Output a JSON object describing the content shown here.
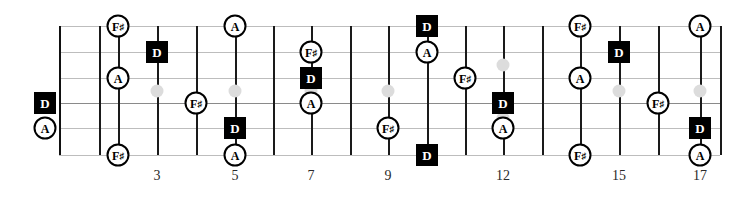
{
  "diagram": {
    "type": "guitar-fretboard",
    "strings": 6,
    "frets_shown": 18,
    "string_y": [
      26,
      52,
      78,
      103,
      128,
      155
    ],
    "fret_x": [
      59,
      99,
      118,
      157,
      196,
      235,
      273,
      311,
      350,
      388,
      427,
      465,
      503,
      542,
      580,
      619,
      658,
      700,
      720
    ],
    "nut_x": 59,
    "board_left": 59,
    "board_right": 720
  },
  "fret_numbers": [
    {
      "label": "3",
      "x": 157
    },
    {
      "label": "5",
      "x": 235
    },
    {
      "label": "7",
      "x": 311
    },
    {
      "label": "9",
      "x": 388
    },
    {
      "label": "12",
      "x": 503
    },
    {
      "label": "15",
      "x": 619
    },
    {
      "label": "17",
      "x": 700
    }
  ],
  "inlays": [
    {
      "x": 157,
      "y": 91
    },
    {
      "x": 235,
      "y": 91
    },
    {
      "x": 311,
      "y": 91
    },
    {
      "x": 388,
      "y": 91
    },
    {
      "x": 503,
      "y": 65
    },
    {
      "x": 503,
      "y": 118
    },
    {
      "x": 619,
      "y": 91
    },
    {
      "x": 700,
      "y": 91
    }
  ],
  "notes": [
    {
      "label": "D",
      "kind": "root",
      "x": 45,
      "y": 103,
      "string": 4,
      "fret": 0
    },
    {
      "label": "A",
      "kind": "tone",
      "x": 45,
      "y": 128,
      "string": 5,
      "fret": 0
    },
    {
      "label": "F#",
      "kind": "tone",
      "x": 118,
      "y": 26,
      "string": 1,
      "fret": 2
    },
    {
      "label": "A",
      "kind": "tone",
      "x": 118,
      "y": 78,
      "string": 3,
      "fret": 2
    },
    {
      "label": "F#",
      "kind": "tone",
      "x": 118,
      "y": 155,
      "string": 6,
      "fret": 2
    },
    {
      "label": "D",
      "kind": "root",
      "x": 157,
      "y": 52,
      "string": 2,
      "fret": 3
    },
    {
      "label": "A",
      "kind": "tone",
      "x": 235,
      "y": 26,
      "string": 1,
      "fret": 5
    },
    {
      "label": "F#",
      "kind": "tone",
      "x": 196,
      "y": 103,
      "string": 4,
      "fret": 4
    },
    {
      "label": "D",
      "kind": "root",
      "x": 235,
      "y": 128,
      "string": 5,
      "fret": 5
    },
    {
      "label": "A",
      "kind": "tone",
      "x": 235,
      "y": 155,
      "string": 6,
      "fret": 5
    },
    {
      "label": "F#",
      "kind": "tone",
      "x": 311,
      "y": 52,
      "string": 2,
      "fret": 7
    },
    {
      "label": "D",
      "kind": "root",
      "x": 311,
      "y": 78,
      "string": 3,
      "fret": 7
    },
    {
      "label": "A",
      "kind": "tone",
      "x": 311,
      "y": 103,
      "string": 4,
      "fret": 7
    },
    {
      "label": "F#",
      "kind": "tone",
      "x": 388,
      "y": 128,
      "string": 5,
      "fret": 9
    },
    {
      "label": "D",
      "kind": "root",
      "x": 427,
      "y": 26,
      "string": 1,
      "fret": 10
    },
    {
      "label": "A",
      "kind": "tone",
      "x": 427,
      "y": 52,
      "string": 2,
      "fret": 10
    },
    {
      "label": "D",
      "kind": "root",
      "x": 427,
      "y": 155,
      "string": 6,
      "fret": 10
    },
    {
      "label": "F#",
      "kind": "tone",
      "x": 465,
      "y": 78,
      "string": 3,
      "fret": 11
    },
    {
      "label": "D",
      "kind": "root",
      "x": 503,
      "y": 103,
      "string": 4,
      "fret": 12
    },
    {
      "label": "A",
      "kind": "tone",
      "x": 503,
      "y": 128,
      "string": 5,
      "fret": 12
    },
    {
      "label": "F#",
      "kind": "tone",
      "x": 580,
      "y": 26,
      "string": 1,
      "fret": 14
    },
    {
      "label": "A",
      "kind": "tone",
      "x": 580,
      "y": 78,
      "string": 3,
      "fret": 14
    },
    {
      "label": "F#",
      "kind": "tone",
      "x": 580,
      "y": 155,
      "string": 6,
      "fret": 14
    },
    {
      "label": "D",
      "kind": "root",
      "x": 619,
      "y": 52,
      "string": 2,
      "fret": 15
    },
    {
      "label": "F#",
      "kind": "tone",
      "x": 658,
      "y": 103,
      "string": 4,
      "fret": 16
    },
    {
      "label": "A",
      "kind": "tone",
      "x": 700,
      "y": 26,
      "string": 1,
      "fret": 17
    },
    {
      "label": "D",
      "kind": "root",
      "x": 700,
      "y": 128,
      "string": 5,
      "fret": 17
    },
    {
      "label": "A",
      "kind": "tone",
      "x": 700,
      "y": 155,
      "string": 6,
      "fret": 17
    }
  ],
  "colors": {
    "root_bg": "#000000",
    "root_fg": "#ffffff",
    "tone_bg": "#ffffff",
    "tone_fg": "#000000",
    "fret_line": "#1a1a1a",
    "string_line": "#bdbdbd",
    "inlay": "#dcdcdc",
    "fret_number": "#2a2a2a"
  }
}
